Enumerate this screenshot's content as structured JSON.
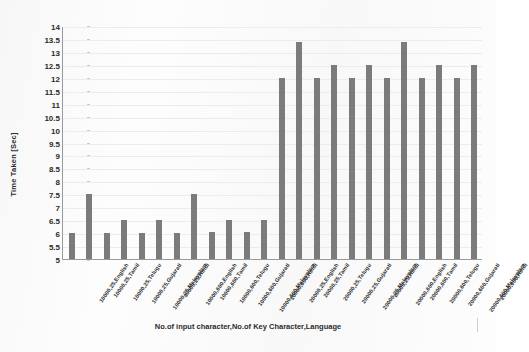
{
  "chart_data": {
    "type": "bar",
    "title": "",
    "xlabel": "No.of input character,No.of Key Character,Language",
    "ylabel": "Time Taken [Sec]",
    "ylim": [
      5,
      14
    ],
    "ytick_step": 0.5,
    "yticks": [
      "14",
      "13.5",
      "13",
      "12.5",
      "12",
      "11.5",
      "11",
      "10.5",
      "10",
      "9.5",
      "9",
      "8.5",
      "8",
      "7.5",
      "7",
      "6.5",
      "6",
      "5.5",
      "5"
    ],
    "grid": true,
    "legend": "none",
    "bar_color": "#7b7b7b",
    "categories": [
      "10000,25,English",
      "10000,25,Tamil",
      "10000,25,Telugu",
      "10000,25,Gujarati",
      "10000,25,Malayalam",
      "10000,25,Hindi",
      "10000,600,English",
      "10000,600,Tamil",
      "10000,600,Telugu",
      "10000,600,Gujarati",
      "10000,600,Malayalam",
      "10000,600,Hindi",
      "20000,25,English",
      "20000,25,Tamil",
      "20000,25,Telugu",
      "20000,25,Gujarati",
      "20000,25,Malayalam",
      "20000,25,Hindi",
      "20000,600,English",
      "20000,600,Tamil",
      "20000,600,Telugu",
      "20000,600,Gujarati",
      "20000,600,Malayalam",
      "20000,600,Hindi"
    ],
    "values": [
      6.0,
      7.5,
      6.0,
      6.5,
      6.0,
      6.5,
      6.0,
      7.5,
      6.05,
      6.5,
      6.05,
      6.5,
      12.0,
      13.4,
      12.0,
      12.5,
      12.0,
      12.5,
      12.0,
      13.4,
      12.0,
      12.5,
      12.0,
      12.5
    ]
  }
}
